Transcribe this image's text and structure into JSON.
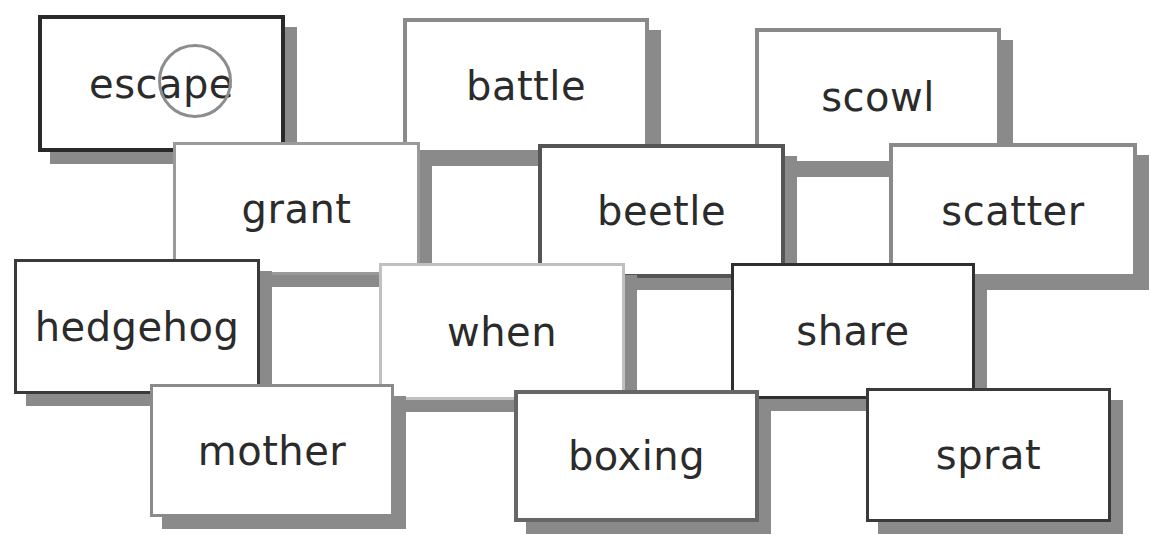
{
  "worksheet": {
    "cards": [
      {
        "word": "escape",
        "x": 38,
        "y": 15,
        "w": 247,
        "h": 137,
        "border": "#2a2a2a",
        "bw": 4,
        "highlight": {
          "letters": "ap",
          "circle": {
            "x": 158,
            "y": 44,
            "d": 74
          }
        }
      },
      {
        "word": "battle",
        "x": 403,
        "y": 18,
        "w": 246,
        "h": 136,
        "border": "#8a8a8a",
        "bw": 4
      },
      {
        "word": "scowl",
        "x": 755,
        "y": 28,
        "w": 246,
        "h": 137,
        "border": "#8a8a8a",
        "bw": 4
      },
      {
        "word": "grant",
        "x": 173,
        "y": 142,
        "w": 247,
        "h": 133,
        "border": "#9a9a9a",
        "bw": 3
      },
      {
        "word": "beetle",
        "x": 538,
        "y": 144,
        "w": 247,
        "h": 134,
        "border": "#555555",
        "bw": 4
      },
      {
        "word": "scatter",
        "x": 889,
        "y": 143,
        "w": 248,
        "h": 135,
        "border": "#8a8a8a",
        "bw": 4
      },
      {
        "word": "hedgehog",
        "x": 14,
        "y": 259,
        "w": 246,
        "h": 135,
        "border": "#3a3a3a",
        "bw": 3
      },
      {
        "word": "when",
        "x": 379,
        "y": 263,
        "w": 246,
        "h": 137,
        "border": "#c0c0c0",
        "bw": 3
      },
      {
        "word": "share",
        "x": 731,
        "y": 263,
        "w": 244,
        "h": 136,
        "border": "#2f2f2f",
        "bw": 3
      },
      {
        "word": "mother",
        "x": 150,
        "y": 384,
        "w": 244,
        "h": 133,
        "border": "#8a8a8a",
        "bw": 3
      },
      {
        "word": "boxing",
        "x": 514,
        "y": 390,
        "w": 245,
        "h": 132,
        "border": "#666666",
        "bw": 4
      },
      {
        "word": "sprat",
        "x": 866,
        "y": 388,
        "w": 245,
        "h": 134,
        "border": "#3a3a3a",
        "bw": 3
      }
    ],
    "shadow_color": "#8a8a8a",
    "shadow_offset": {
      "dx": 12,
      "dy": 12
    },
    "highlight_color": "#8d8d8d",
    "text_color": "#2b2b2b"
  }
}
